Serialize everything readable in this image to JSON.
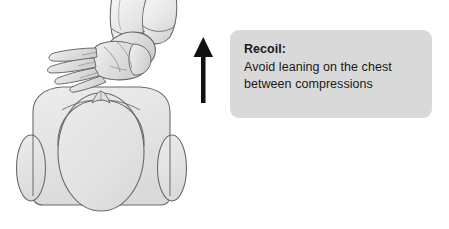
{
  "illustration": {
    "title": "CPR chest compression recoil technique diagram",
    "subject": "Two interlaced hands positioned over the chest of a supine torso viewed from the head end, with an upward arrow indicating chest recoil",
    "parts": {
      "hands": "interlaced-hands",
      "forearms": "forearms",
      "torso": "torso-shoulders",
      "left_arm": "left-arm",
      "right_arm": "right-arm",
      "chest": "chest-ribcage",
      "sternal_notch": "suprasternal-notch",
      "arrow": "upward-recoil-arrow"
    }
  },
  "callout": {
    "title": "Recoil:",
    "line1": "Avoid leaning on the chest",
    "line2": "between compressions"
  },
  "colors": {
    "background": "#ffffff",
    "callout_background": "#d9d9d9",
    "body_fill": "#e4e4e4",
    "body_fill_light": "#eeeeee",
    "outline": "#595959",
    "arrow": "#111111",
    "text": "#1a1a1a"
  }
}
